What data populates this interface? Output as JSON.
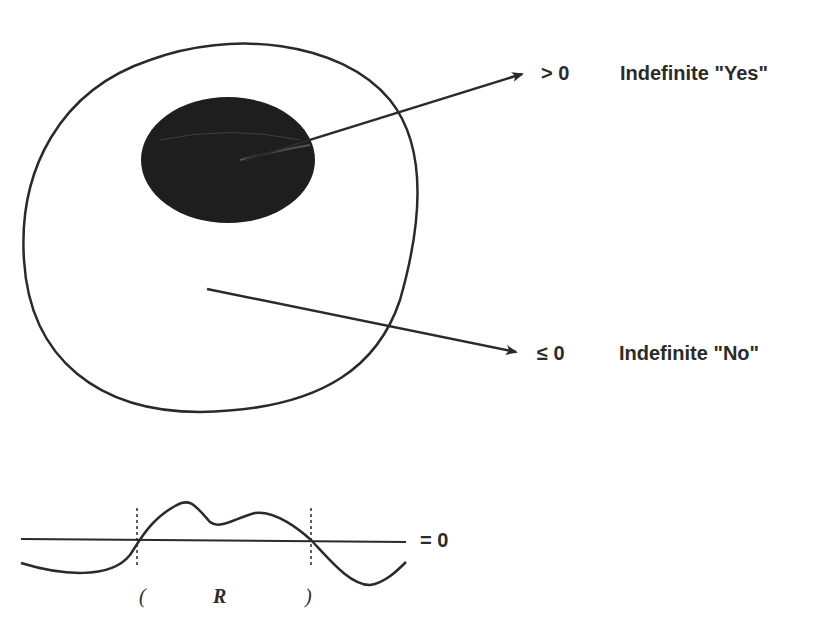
{
  "diagram": {
    "region": {
      "outer_set": "blob",
      "inner_region": "dark-ellipse"
    },
    "arrows": [
      {
        "target_symbol": "> 0",
        "label": "Indefinite \"Yes\""
      },
      {
        "target_symbol": "≤ 0",
        "label": "Indefinite \"No\""
      }
    ],
    "graph": {
      "baseline_label": "= 0",
      "interval_open": "(",
      "interval_close": ")",
      "interval_name": "R"
    },
    "colors": {
      "stroke": "#2a2a2a",
      "fill_dark": "#1e1e1e",
      "background": "#ffffff"
    }
  }
}
